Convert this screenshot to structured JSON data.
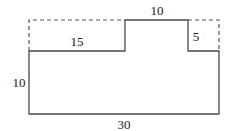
{
  "diagram": {
    "title": "",
    "shape": "composite rectangle with notches",
    "labels": {
      "top_step_width": "10",
      "left_notch_width": "15",
      "right_notch_height": "5",
      "left_height": "10",
      "bottom_width": "30"
    },
    "colors": {
      "line": "#4a4a4a",
      "dashed": "#555555",
      "background": "#ffffff"
    }
  }
}
